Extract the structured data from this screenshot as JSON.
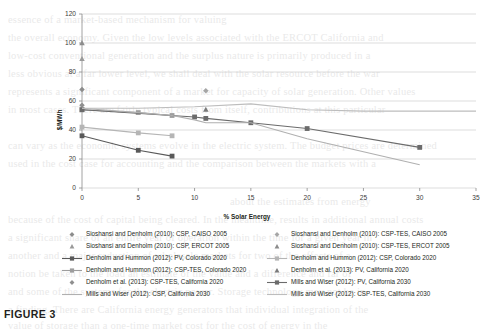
{
  "figure": {
    "caption": "FIGURE 3"
  },
  "chart_data": {
    "type": "scatter",
    "title": "",
    "xlabel": "% Solar Energy",
    "ylabel": "$/MWh",
    "xlim": [
      0,
      35
    ],
    "ylim": [
      0,
      120
    ],
    "xticks": [
      "0",
      "5",
      "10",
      "15",
      "20",
      "25",
      "30",
      "35"
    ],
    "yticks": [
      "0",
      "20",
      "40",
      "60",
      "80",
      "100",
      "120"
    ],
    "grid": "horizontal",
    "legend_position": "bottom",
    "series": [
      {
        "name": "Sioshansi and Denholm (2010): CSP, CAISO 2005",
        "marker": "diamond",
        "line": "none",
        "color": "#8c8c8c",
        "points": [
          [
            0,
            68
          ]
        ]
      },
      {
        "name": "Sioshansi and Denholm (2010): CSP-TES, CAISO 2005",
        "marker": "diamond",
        "line": "none",
        "color": "#a6a6a6",
        "points": [
          [
            11,
            67
          ]
        ]
      },
      {
        "name": "Sioshansi and Denholm (2010): CSP, ERCOT 2005",
        "marker": "triangle",
        "line": "none",
        "color": "#9a9a9a",
        "points": [
          [
            0,
            89
          ]
        ]
      },
      {
        "name": "Sioshansi and Denholm (2010): CSP-TES, ERCOT 2005",
        "marker": "triangle",
        "line": "none",
        "color": "#8c8c8c",
        "points": [
          [
            0,
            100
          ]
        ]
      },
      {
        "name": "Denholm and Hummon (2012): PV, Colorado 2020",
        "marker": "square",
        "line": "solid",
        "color": "#595959",
        "points": [
          [
            0,
            36
          ],
          [
            5,
            26
          ],
          [
            8,
            22
          ]
        ]
      },
      {
        "name": "Denholm and Hummon (2012): CSP, Colorado 2020",
        "marker": "square",
        "line": "solid",
        "color": "#b5b5b5",
        "points": [
          [
            0,
            42
          ],
          [
            5,
            38
          ],
          [
            8,
            36
          ]
        ]
      },
      {
        "name": "Denholm and Hummon (2012): CSP-TES, Colorado 2020",
        "marker": "square",
        "line": "solid",
        "color": "#9d9d9d",
        "points": [
          [
            0,
            54
          ],
          [
            5,
            52
          ],
          [
            8,
            50
          ]
        ]
      },
      {
        "name": "Denholm et al. (2013): PV, California 2020",
        "marker": "triangle",
        "line": "none",
        "color": "#7a7a7a",
        "points": [
          [
            11,
            54
          ]
        ]
      },
      {
        "name": "Denholm et al. (2013): CSP-TES, California 2020",
        "marker": "diamond",
        "line": "none",
        "color": "#8f8f8f",
        "points": [
          [
            0,
            57
          ]
        ]
      },
      {
        "name": "Mills and Wiser (2012): PV, California 2030",
        "marker": "square",
        "line": "solid",
        "color": "#6b6b6b",
        "points": [
          [
            0,
            54
          ],
          [
            10,
            49
          ],
          [
            11,
            48
          ],
          [
            15,
            45
          ],
          [
            20,
            41
          ],
          [
            30,
            28
          ]
        ]
      },
      {
        "name": "Mills and Wiser (2012): CSP, California 2030",
        "marker": "none",
        "line": "solid",
        "color": "#b0b0b0",
        "points": [
          [
            0,
            55
          ],
          [
            5,
            52
          ],
          [
            8,
            50
          ],
          [
            10,
            47
          ],
          [
            11,
            45
          ],
          [
            15,
            45
          ],
          [
            20,
            34
          ],
          [
            30,
            16
          ]
        ]
      },
      {
        "name": "Mills and Wiser (2012): CSP-TES, California 2030",
        "marker": "none",
        "line": "solid",
        "color": "#bdbdbd",
        "points": [
          [
            0,
            55
          ],
          [
            5,
            55
          ],
          [
            10,
            56
          ],
          [
            15,
            58
          ],
          [
            20,
            54
          ],
          [
            25,
            53
          ],
          [
            30,
            53
          ],
          [
            35,
            53
          ]
        ]
      }
    ]
  },
  "legend": {
    "left_column": [
      {
        "label": "Sioshansi and Denholm (2010): CSP, CAISO 2005",
        "marker": "diamond",
        "line": "none",
        "color": "#8c8c8c"
      },
      {
        "label": "Sioshansi and Denholm (2010): CSP, ERCOT 2005",
        "marker": "triangle",
        "line": "none",
        "color": "#9a9a9a"
      },
      {
        "label": "Denholm and Hummon (2012): PV, Colorado 2020",
        "marker": "square",
        "line": "solid",
        "color": "#595959"
      },
      {
        "label": "Denholm and Hummon (2012): CSP-TES, Colorado 2020",
        "marker": "square",
        "line": "solid",
        "color": "#9d9d9d"
      },
      {
        "label": "Denholm et al. (2013): CSP-TES, California 2020",
        "marker": "diamond",
        "line": "none",
        "color": "#8f8f8f"
      },
      {
        "label": "Mills and Wiser (2012): CSP, California 2030",
        "marker": "none",
        "line": "solid",
        "color": "#b0b0b0"
      }
    ],
    "right_column": [
      {
        "label": "Sioshansi and Denholm (2010): CSP-TES, CAISO 2005",
        "marker": "diamond",
        "line": "none",
        "color": "#a6a6a6"
      },
      {
        "label": "Sioshansi and Denholm (2010): CSP-TES, ERCOT 2005",
        "marker": "triangle",
        "line": "none",
        "color": "#8c8c8c"
      },
      {
        "label": "Denholm and Hummon (2012): CSP, Colorado 2020",
        "marker": "square",
        "line": "solid",
        "color": "#b5b5b5"
      },
      {
        "label": "Denholm et al. (2013): PV, California 2020",
        "marker": "triangle",
        "line": "none",
        "color": "#7a7a7a"
      },
      {
        "label": "Mills and Wiser (2012): PV, California 2030",
        "marker": "square",
        "line": "solid",
        "color": "#6b6b6b"
      },
      {
        "label": "Mills and Wiser (2012): CSP-TES, California 2030",
        "marker": "none",
        "line": "solid",
        "color": "#bdbdbd"
      }
    ]
  }
}
